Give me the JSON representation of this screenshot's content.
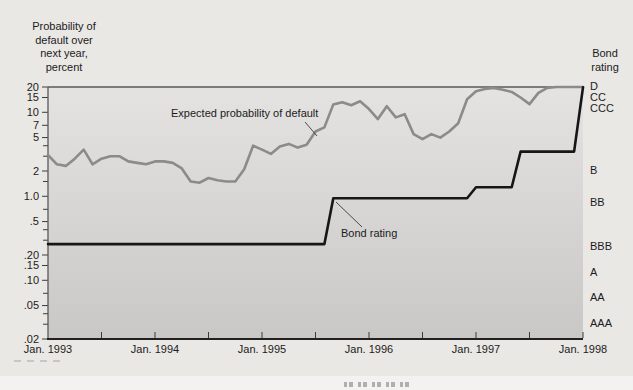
{
  "chart": {
    "colors": {
      "page_bg": "#eae8e5",
      "page_bottom_strip": "#f3f2f0",
      "plot_bg_top": "#e4e3e1",
      "plot_bg_bottom": "#c9c8c6",
      "axis": "#3c3c3a",
      "frame": "#585856",
      "frame_dark": "#23211f",
      "text": "#1b1b1b",
      "expected_line": "#8b8b89",
      "bond_line": "#161616"
    }
  },
  "chart_data": {
    "type": "line",
    "yscale": "log",
    "ylim": [
      0.02,
      20
    ],
    "grid": false,
    "x_unit": "month",
    "x_range": [
      "Jan 1993",
      "Jan 1998"
    ],
    "y_axis_title": "Probability of\ndefault over\nnext year,\npercent",
    "right_axis_title": "Bond\nrating",
    "x_labels": [
      "Jan. 1993",
      "Jan. 1994",
      "Jan. 1995",
      "Jan. 1996",
      "Jan. 1997",
      "Jan. 1998"
    ],
    "y_ticks": [
      {
        "v": 20,
        "t": "20"
      },
      {
        "v": 15,
        "t": "15"
      },
      {
        "v": 10,
        "t": "10"
      },
      {
        "v": 7,
        "t": "7"
      },
      {
        "v": 5,
        "t": "5"
      },
      {
        "v": 2,
        "t": "2"
      },
      {
        "v": 1.0,
        "t": "1.0"
      },
      {
        "v": 0.5,
        "t": ".5"
      },
      {
        "v": 0.2,
        "t": ".20"
      },
      {
        "v": 0.15,
        "t": ".15"
      },
      {
        "v": 0.1,
        "t": ".10"
      },
      {
        "v": 0.05,
        "t": ".05"
      },
      {
        "v": 0.02,
        "t": ".02"
      }
    ],
    "y_minor_ticks": [
      4,
      3,
      1.5,
      0.7,
      0.4,
      0.3,
      0.07,
      0.04,
      0.03
    ],
    "right_ratings": [
      {
        "label": "D",
        "v": 20.3
      },
      {
        "label": "CC",
        "v": 14.8
      },
      {
        "label": "CCC",
        "v": 11.2
      },
      {
        "label": "B",
        "v": 2.05
      },
      {
        "label": "BB",
        "v": 0.85
      },
      {
        "label": "BBB",
        "v": 0.255
      },
      {
        "label": "A",
        "v": 0.125
      },
      {
        "label": "AA",
        "v": 0.063
      },
      {
        "label": "AAA",
        "v": 0.031
      }
    ],
    "series": [
      {
        "name": "Expected probability of default",
        "color": "#8b8b89",
        "values": [
          3.1,
          2.4,
          2.3,
          2.8,
          3.6,
          2.4,
          2.8,
          3.0,
          3.0,
          2.6,
          2.5,
          2.4,
          2.6,
          2.6,
          2.5,
          2.15,
          1.5,
          1.45,
          1.65,
          1.55,
          1.5,
          1.5,
          2.1,
          4.0,
          3.6,
          3.2,
          3.9,
          4.2,
          3.8,
          4.1,
          5.9,
          6.6,
          12.4,
          13.2,
          12.1,
          13.5,
          10.9,
          8.3,
          11.8,
          8.7,
          9.5,
          5.5,
          4.8,
          5.5,
          5.0,
          5.9,
          7.4,
          14.3,
          17.8,
          19.0,
          19.5,
          18.5,
          17.5,
          15.0,
          12.5,
          17.0,
          19.5,
          20,
          20,
          20,
          20
        ]
      },
      {
        "name": "Bond rating",
        "color": "#161616",
        "values": [
          0.27,
          0.27,
          0.27,
          0.27,
          0.27,
          0.27,
          0.27,
          0.27,
          0.27,
          0.27,
          0.27,
          0.27,
          0.27,
          0.27,
          0.27,
          0.27,
          0.27,
          0.27,
          0.27,
          0.27,
          0.27,
          0.27,
          0.27,
          0.27,
          0.27,
          0.27,
          0.27,
          0.27,
          0.27,
          0.27,
          0.27,
          0.27,
          0.95,
          0.95,
          0.95,
          0.95,
          0.95,
          0.95,
          0.95,
          0.95,
          0.95,
          0.95,
          0.95,
          0.95,
          0.95,
          0.95,
          0.95,
          0.95,
          1.28,
          1.28,
          1.28,
          1.28,
          1.28,
          3.4,
          3.4,
          3.4,
          3.4,
          3.4,
          3.4,
          3.4,
          19.8
        ]
      }
    ],
    "annotations": [
      {
        "text": "Expected probability of default",
        "x": 171,
        "y": 107,
        "leader": [
          305,
          122,
          317,
          136
        ]
      },
      {
        "text": "Bond rating",
        "x": 341,
        "y": 227,
        "leader": [
          336,
          202,
          362,
          227
        ]
      }
    ]
  }
}
